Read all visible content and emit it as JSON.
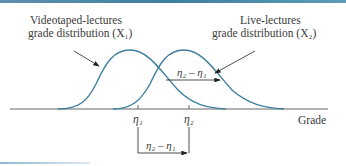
{
  "figure": {
    "labels": {
      "left_title_line1": "Videotaped-lectures",
      "left_title_line2": "grade distribution (X₁)",
      "right_title_line1": "Live-lectures",
      "right_title_line2": "grade distribution (X₂)",
      "shift_label_top": "η₂ – η₁",
      "shift_label_bottom": "η₂ – η₁",
      "eta1": "η₁",
      "eta2": "η₂",
      "axis_label": "Grade"
    },
    "colors": {
      "curve": "#3f7f9f",
      "axis": "#555555",
      "accent_bar": "#3d7ea3"
    }
  }
}
